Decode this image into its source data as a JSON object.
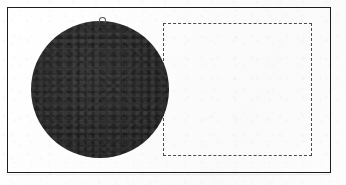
{
  "figure": {
    "caption": "",
    "canvas": {
      "width": 346,
      "height": 185,
      "background_color": "#fdfdfd",
      "media": "scanned-page"
    },
    "frame": {
      "name": "outer-border",
      "style": "solid",
      "color": "#1d1d1d",
      "stroke_width": 1.6,
      "x": 7,
      "y": 7,
      "width": 324,
      "height": 166
    },
    "shapes": [
      {
        "id": "ellipse-1",
        "type": "ellipse",
        "label": "",
        "fill": "#2d2d2d",
        "stroke": "none",
        "filled": true,
        "center_x": 100,
        "center_y": 89.5,
        "radius_x": 69,
        "radius_y": 68.5,
        "x": 31,
        "y": 21,
        "width": 138,
        "height": 137,
        "has_stem": true
      },
      {
        "id": "rect-1",
        "type": "rectangle",
        "label": "",
        "fill": "none",
        "stroke": "#4a4a4a",
        "stroke_style": "dashed",
        "stroke_width": 1.3,
        "dash_length": 2,
        "gap_length": 2,
        "x": 163,
        "y": 23,
        "width": 149,
        "height": 133
      }
    ],
    "annotations": {
      "stem": {
        "id": "ellipse-stem",
        "description": "small arc nub at top of ellipse",
        "x": 99,
        "y": 17,
        "width": 5,
        "height": 5,
        "color": "#555555"
      }
    },
    "relationship": "The dashed rectangle overlaps the right portion of the filled ellipse.",
    "colors": {
      "page": "#fdfdfd",
      "border": "#1d1d1d",
      "shape_fill": "#2d2d2d",
      "dashed_stroke": "#4a4a4a"
    }
  }
}
